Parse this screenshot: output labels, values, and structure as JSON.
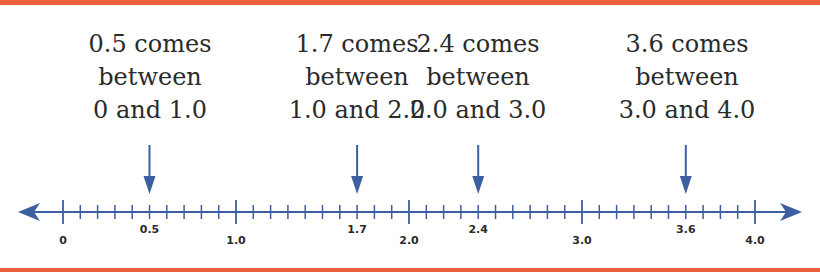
{
  "colors": {
    "border": "#e8603c",
    "axis": "#3b5fa0",
    "text": "#2b2b2b"
  },
  "captions": [
    {
      "line1": "0.5 comes",
      "line2": "between",
      "line3": "0 and 1.0",
      "value": 0.5
    },
    {
      "line1": "1.7 comes",
      "line2": "between",
      "line3": "1.0 and 2.0",
      "value": 1.7
    },
    {
      "line1": "2.4 comes",
      "line2": "between",
      "line3": "2.0 and 3.0",
      "value": 2.4
    },
    {
      "line1": "3.6 comes",
      "line2": "between",
      "line3": "3.0 and 4.0",
      "value": 3.6
    }
  ],
  "number_line": {
    "min": 0,
    "max": 4.0,
    "minor_step": 0.1,
    "major_step": 1.0,
    "labels": [
      {
        "text": "0",
        "value": 0
      },
      {
        "text": "0.5",
        "value": 0.5
      },
      {
        "text": "1.0",
        "value": 1.0
      },
      {
        "text": "1.7",
        "value": 1.7
      },
      {
        "text": "2.0",
        "value": 2.0
      },
      {
        "text": "2.4",
        "value": 2.4
      },
      {
        "text": "3.0",
        "value": 3.0
      },
      {
        "text": "3.6",
        "value": 3.6
      },
      {
        "text": "4.0",
        "value": 4.0
      }
    ],
    "marked_values": [
      0.5,
      1.7,
      2.4,
      3.6
    ]
  }
}
